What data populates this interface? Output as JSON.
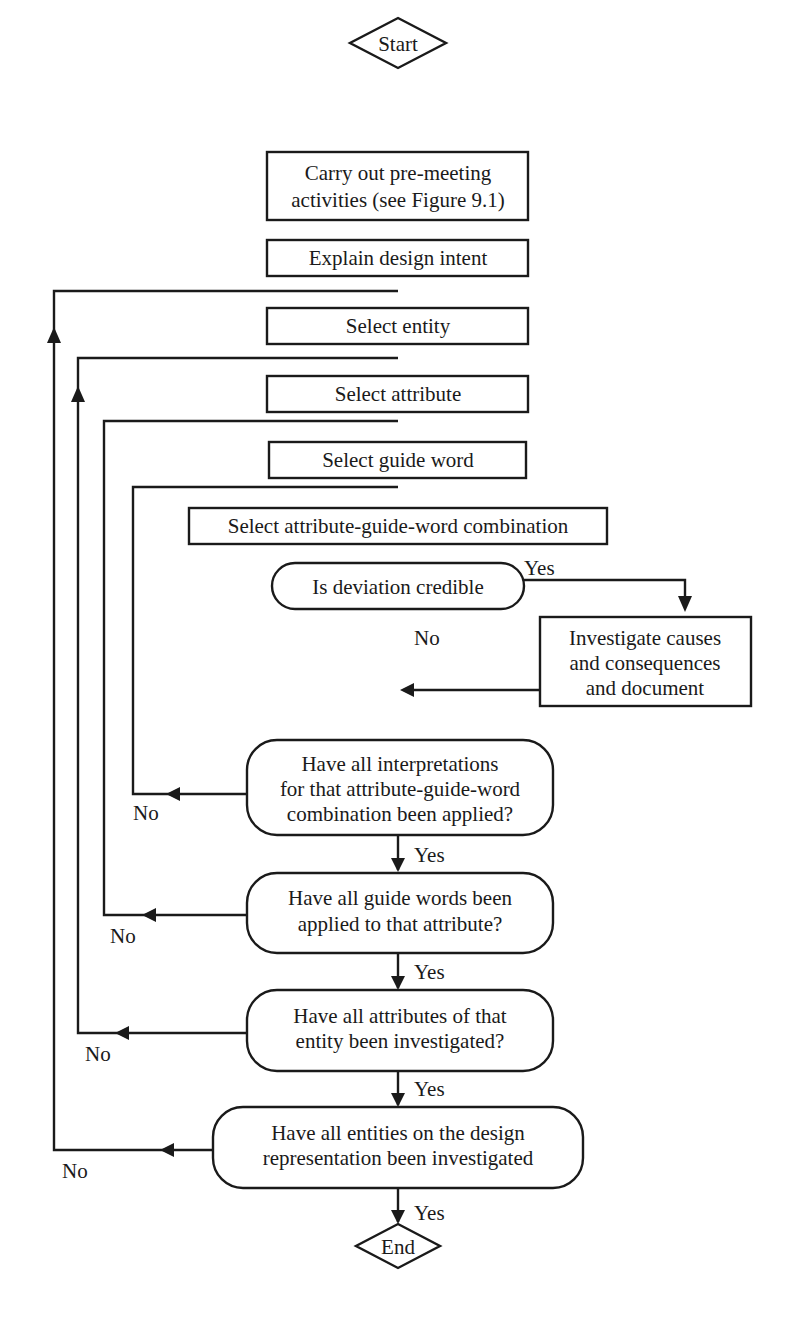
{
  "diagram": {
    "start": "Start",
    "end": "End",
    "steps": {
      "pre_meeting": [
        "Carry out pre-meeting",
        "activities (see Figure 9.1)"
      ],
      "explain": "Explain design intent",
      "select_entity": "Select entity",
      "select_attribute": "Select attribute",
      "select_guide_word": "Select guide word",
      "select_combination": "Select attribute-guide-word combination",
      "investigate": [
        "Investigate causes",
        "and consequences",
        "and document"
      ]
    },
    "decisions": {
      "credible": "Is deviation credible",
      "interpretations": [
        "Have all interpretations",
        "for that attribute-guide-word",
        "combination been applied?"
      ],
      "guide_words": [
        "Have all guide words been",
        "applied to that attribute?"
      ],
      "attributes": [
        "Have all attributes of that",
        "entity been investigated?"
      ],
      "entities": [
        "Have all entities on the design",
        "representation been investigated"
      ]
    },
    "labels": {
      "yes": "Yes",
      "no": "No"
    },
    "colors": {
      "stroke": "#1a1a1a",
      "background": "#ffffff"
    }
  }
}
